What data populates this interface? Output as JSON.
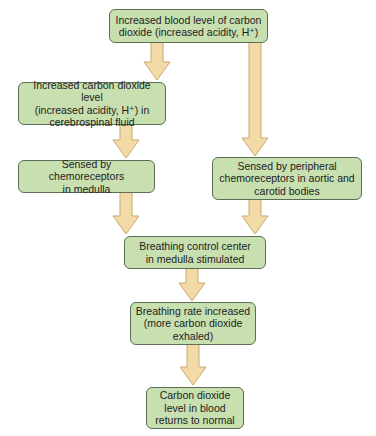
{
  "diagram": {
    "title": "",
    "colors": {
      "box_fill": "#c8dfb0",
      "box_border": "#5c6e55",
      "arrow_fill": "#f3dba8",
      "arrow_border": "#c9a96e"
    },
    "nodes": [
      {
        "id": "n1",
        "label": "Increased blood level of carbon\ndioxide (increased acidity, H⁺)"
      },
      {
        "id": "n2",
        "label": "Increased carbon dioxide level\n(increased acidity, H⁺) in\ncerebrospinal fluid"
      },
      {
        "id": "n3",
        "label": "Sensed by chemoreceptors\nin medulla"
      },
      {
        "id": "n4",
        "label": "Sensed by peripheral\nchemoreceptors in aortic and\ncarotid bodies"
      },
      {
        "id": "n5",
        "label": "Breathing control center\nin medulla stimulated"
      },
      {
        "id": "n6",
        "label": "Breathing rate increased\n(more carbon dioxide\nexhaled)"
      },
      {
        "id": "n7",
        "label": "Carbon dioxide\nlevel in blood\nreturns to normal"
      }
    ],
    "edges": [
      {
        "from": "n1",
        "to": "n2"
      },
      {
        "from": "n1",
        "to": "n4"
      },
      {
        "from": "n2",
        "to": "n3"
      },
      {
        "from": "n3",
        "to": "n5"
      },
      {
        "from": "n4",
        "to": "n5"
      },
      {
        "from": "n5",
        "to": "n6"
      },
      {
        "from": "n6",
        "to": "n7"
      }
    ]
  }
}
